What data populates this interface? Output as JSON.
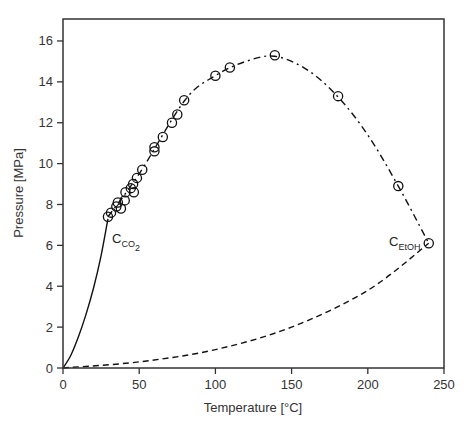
{
  "chart_data": {
    "type": "scatter",
    "title": "",
    "xlabel": "Temperature [°C]",
    "ylabel": "Pressure [MPa]",
    "xlim": [
      0,
      250
    ],
    "ylim": [
      0,
      17
    ],
    "x_ticks": [
      0,
      50,
      100,
      150,
      200,
      250
    ],
    "y_ticks": [
      0,
      2,
      4,
      6,
      8,
      10,
      12,
      14,
      16
    ],
    "grid": false,
    "legend": null,
    "series": [
      {
        "name": "Measured critical points (CO2–EtOH)",
        "style": "open-circle",
        "x": [
          29.5,
          31.5,
          35,
          36,
          38,
          40.5,
          41,
          44.5,
          46,
          46.5,
          48.5,
          52,
          60,
          60,
          65.5,
          71.5,
          75,
          79.5,
          100,
          109.5,
          139,
          180.5,
          220,
          240
        ],
        "y": [
          7.4,
          7.6,
          7.9,
          8.1,
          7.8,
          8.2,
          8.6,
          8.8,
          9.0,
          8.6,
          9.3,
          9.7,
          10.6,
          10.8,
          11.3,
          12.0,
          12.4,
          13.1,
          14.3,
          14.7,
          15.3,
          13.3,
          8.9,
          6.1
        ]
      },
      {
        "name": "CO2 vapor pressure curve",
        "style": "solid-line",
        "x": [
          0,
          5,
          10,
          15,
          20,
          25,
          29.5
        ],
        "y": [
          0,
          0.6,
          1.5,
          2.6,
          3.9,
          5.5,
          7.3
        ]
      },
      {
        "name": "EtOH vapor pressure curve",
        "style": "dashed-line",
        "x": [
          0,
          50,
          100,
          150,
          200,
          240
        ],
        "y": [
          0,
          0.3,
          0.9,
          2.0,
          3.8,
          6.1
        ]
      },
      {
        "name": "Critical locus fit",
        "style": "dash-dot-line",
        "x": [
          29.5,
          50,
          80,
          100,
          120,
          139,
          160,
          180,
          200,
          220,
          240
        ],
        "y": [
          7.4,
          9.5,
          13.1,
          14.3,
          15.0,
          15.25,
          14.6,
          13.3,
          11.4,
          8.9,
          6.1
        ]
      }
    ],
    "annotations": [
      {
        "text": "C",
        "subscript": "CO2",
        "x": 32,
        "y": 6.3
      },
      {
        "text": "C",
        "subscript": "EtOH",
        "x": 213,
        "y": 6.1
      }
    ]
  },
  "labels": {
    "xlabel": "Temperature [°C]",
    "ylabel": "Pressure [MPa]",
    "co2_main": "C",
    "co2_sub": "CO",
    "co2_sub2": "2",
    "etoh_main": "C",
    "etoh_sub": "EtOH"
  }
}
